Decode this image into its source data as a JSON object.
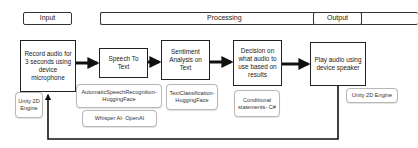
{
  "headers": {
    "input": "Input",
    "processing": "Processing",
    "output": "Output"
  },
  "steps": [
    {
      "id": "record",
      "label": "Record audio for 3 seconds using device microphone"
    },
    {
      "id": "stt",
      "label": "Speech To Text"
    },
    {
      "id": "sentiment",
      "label": "Sentiment Analysis on Text"
    },
    {
      "id": "decision",
      "label": "Decision on what audio to use based on results"
    },
    {
      "id": "play",
      "label": "Play audio using device speaker"
    }
  ],
  "tools": {
    "record": [
      "Unity 2D Engine"
    ],
    "stt": [
      "AutomaticSpeechRecognition- HuggingFace",
      "Whisper AI- OpenAI"
    ],
    "sentiment": [
      "TextClassification- HuggingFace"
    ],
    "decision": [
      "Conditional statements- C#"
    ],
    "play": [
      "Unity 2D Engine"
    ]
  },
  "colors": {
    "arrow": "#111111",
    "main_border": "#222222",
    "tool_border": "#b8b8b8"
  }
}
